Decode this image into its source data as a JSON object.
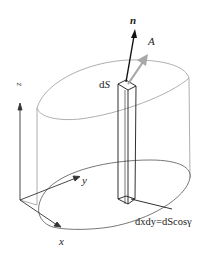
{
  "diagram": {
    "title": "",
    "labels": {
      "normal": "n",
      "vector": "A",
      "surface_element": "dS",
      "surface_element_d": "d",
      "surface_element_s": "S",
      "axis_x": "x",
      "axis_y": "y",
      "axis_z": "z",
      "projection_formula": "dxdy=dScosγ"
    },
    "colors": {
      "outline": "#9a9a9a",
      "column": "#1a1a1a",
      "normal_arrow": "#111111",
      "vector_arrow": "#a8a8a8",
      "axes": "#333333"
    }
  }
}
